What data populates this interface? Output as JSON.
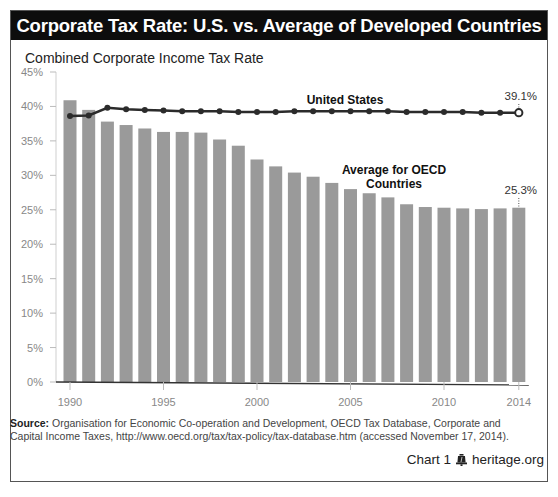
{
  "title": "Corporate Tax Rate: U.S. vs. Average of Developed Countries",
  "subtitle": "Combined Corporate Income Tax Rate",
  "source": {
    "label": "Source:",
    "text": "Organisation for Economic Co-operation and Development, OECD Tax Database, Corporate and Capital Income Taxes, http://www.oecd.org/tax/tax-policy/tax-database.htm (accessed November 17, 2014)."
  },
  "footer": {
    "chart_label": "Chart 1",
    "site": "heritage.org",
    "icon": "liberty-bell-icon"
  },
  "colors": {
    "title_bg": "#0d0d0d",
    "bar": "#9a9a9a",
    "line": "#2b2b2b",
    "axis": "#333333",
    "tick_text": "#888888"
  },
  "chart_data": {
    "type": "bar",
    "title": "Corporate Tax Rate: U.S. vs. Average of Developed Countries",
    "subtitle": "Combined Corporate Income Tax Rate",
    "xlabel": "",
    "ylabel": "Combined Corporate Income Tax Rate",
    "ylim": [
      0,
      45
    ],
    "yticks": [
      "0%",
      "5%",
      "10%",
      "15%",
      "20%",
      "25%",
      "30%",
      "35%",
      "40%",
      "45%"
    ],
    "xticks": [
      "1990",
      "1995",
      "2000",
      "2005",
      "2010",
      "2014"
    ],
    "grid": false,
    "legend_position": "inline annotations",
    "categories": [
      "1990",
      "1991",
      "1992",
      "1993",
      "1994",
      "1995",
      "1996",
      "1997",
      "1998",
      "1999",
      "2000",
      "2001",
      "2002",
      "2003",
      "2004",
      "2005",
      "2006",
      "2007",
      "2008",
      "2009",
      "2010",
      "2011",
      "2012",
      "2013",
      "2014"
    ],
    "series": [
      {
        "name": "Average for OECD Countries",
        "type": "bar",
        "values": [
          40.9,
          39.5,
          37.8,
          37.3,
          36.8,
          36.3,
          36.3,
          36.2,
          35.2,
          34.3,
          32.3,
          31.3,
          30.4,
          29.8,
          28.9,
          28.0,
          27.4,
          26.8,
          25.8,
          25.4,
          25.3,
          25.2,
          25.1,
          25.2,
          25.3
        ]
      },
      {
        "name": "United States",
        "type": "line",
        "values": [
          38.6,
          38.7,
          39.8,
          39.6,
          39.5,
          39.4,
          39.3,
          39.3,
          39.3,
          39.2,
          39.2,
          39.2,
          39.3,
          39.3,
          39.3,
          39.3,
          39.3,
          39.3,
          39.2,
          39.2,
          39.2,
          39.2,
          39.1,
          39.1,
          39.1
        ]
      }
    ],
    "annotations": [
      {
        "text": "United States",
        "series": "United States"
      },
      {
        "text": "Average for OECD Countries",
        "series": "Average for OECD Countries"
      },
      {
        "text": "39.1%",
        "x": "2014",
        "series": "United States"
      },
      {
        "text": "25.3%",
        "x": "2014",
        "series": "Average for OECD Countries"
      }
    ]
  }
}
